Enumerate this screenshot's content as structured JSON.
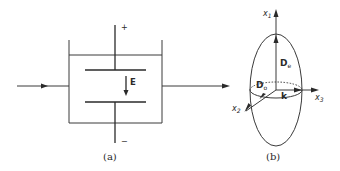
{
  "figure_a": {
    "caption": "(a)",
    "positive_terminal": "+",
    "negative_terminal": "−",
    "field_label": "E"
  },
  "figure_b": {
    "caption": "(b)",
    "axis_x1": "x",
    "axis_x1_sub": "1",
    "axis_x2": "x",
    "axis_x2_sub": "2",
    "axis_x3": "x",
    "axis_x3_sub": "3",
    "extraordinary_label": "D",
    "extraordinary_sub": "e",
    "ordinary_label": "D",
    "ordinary_sub": "o",
    "wavevector_label": "k"
  },
  "colors": {
    "stroke": "#3a3a3a",
    "background": "#ffffff"
  }
}
